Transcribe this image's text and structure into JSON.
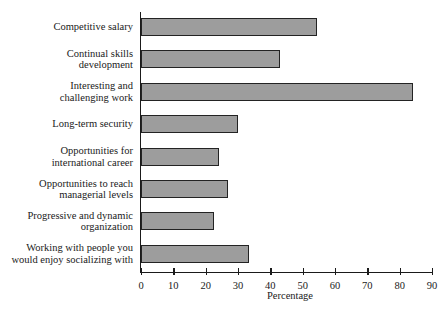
{
  "chart_data": {
    "type": "bar",
    "orientation": "horizontal",
    "title": "",
    "xlabel": "Percentage",
    "ylabel": "",
    "xlim": [
      0,
      90
    ],
    "xticks": [
      0,
      10,
      20,
      30,
      40,
      50,
      60,
      70,
      80,
      90
    ],
    "grid": false,
    "legend": false,
    "bar_color": "#9d9d9d",
    "bar_border_color": "#232323",
    "background": "#ffffff",
    "categories": [
      "Competitive salary",
      "Continual skills\ndevelopment",
      "Interesting and\nchallenging work",
      "Long-term security",
      "Opportunities for\ninternational career",
      "Opportunities to reach\nmanagerial levels",
      "Progressive and dynamic\norganization",
      "Working with people you\nwould enjoy socializing with"
    ],
    "values": [
      54.5,
      43,
      84,
      30,
      24,
      27,
      22.5,
      33.5
    ]
  }
}
